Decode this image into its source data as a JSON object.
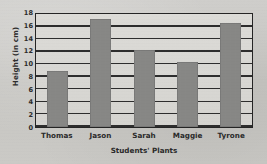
{
  "chart_data": {
    "type": "bar",
    "title": "",
    "xlabel": "Students' Plants",
    "ylabel": "Height (in cm)",
    "categories": [
      "Thomas",
      "Jason",
      "Sarah",
      "Maggie",
      "Tyrone"
    ],
    "values": [
      9,
      17.2,
      12.2,
      10.3,
      16.5
    ],
    "ylim": [
      0,
      18
    ],
    "ytick_labels": [
      "0",
      "2",
      "4",
      "6",
      "8",
      "10",
      "12",
      "14",
      "16",
      "18"
    ],
    "ytick_values": [
      0,
      2,
      4,
      6,
      8,
      10,
      12,
      14,
      16,
      18
    ],
    "grid": "horizontal",
    "legend": "none",
    "bar_color": "#878785",
    "grid_color": "#2d2d2d",
    "plot_background": "#d8d7d3",
    "page_background": "#c9c8c4"
  }
}
